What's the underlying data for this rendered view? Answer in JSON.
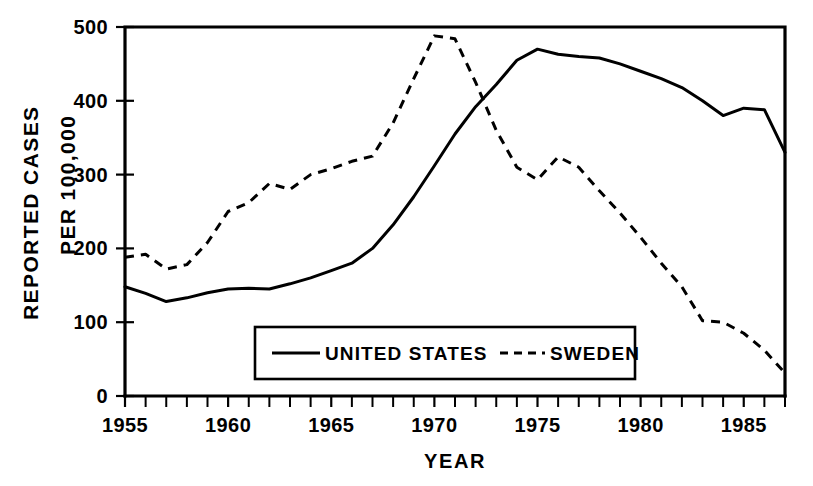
{
  "chart_data": {
    "type": "line",
    "title": "",
    "xlabel": "YEAR",
    "ylabel": "REPORTED CASES PER 100,000",
    "ylabel_line1": "REPORTED CASES",
    "ylabel_line2": "PER 100,000",
    "xlim": [
      1955,
      1987
    ],
    "ylim": [
      0,
      500
    ],
    "ytick_labels": [
      "0",
      "100",
      "200",
      "300",
      "400",
      "500"
    ],
    "ytick_values": [
      0,
      100,
      200,
      300,
      400,
      500
    ],
    "xtick_labels": [
      "1955",
      "1960",
      "1965",
      "1970",
      "1975",
      "1980",
      "1985"
    ],
    "xtick_values": [
      1955,
      1960,
      1965,
      1970,
      1975,
      1980,
      1985
    ],
    "xtick_minor_step": 1,
    "grid": false,
    "legend_position": "inside-bottom-center",
    "x": [
      1955,
      1956,
      1957,
      1958,
      1959,
      1960,
      1961,
      1962,
      1963,
      1964,
      1965,
      1966,
      1967,
      1968,
      1969,
      1970,
      1971,
      1972,
      1973,
      1974,
      1975,
      1976,
      1977,
      1978,
      1979,
      1980,
      1981,
      1982,
      1983,
      1984,
      1985,
      1986,
      1987
    ],
    "series": [
      {
        "name": "UNITED STATES",
        "style": "solid",
        "color": "#000000",
        "values": [
          148,
          139,
          128,
          133,
          140,
          145,
          146,
          145,
          152,
          160,
          170,
          180,
          200,
          232,
          270,
          312,
          355,
          392,
          422,
          455,
          470,
          463,
          460,
          458,
          450,
          440,
          430,
          418,
          400,
          380,
          390,
          388,
          330
        ]
      },
      {
        "name": "SWEDEN",
        "style": "dashed",
        "color": "#000000",
        "values": [
          188,
          192,
          172,
          178,
          208,
          250,
          262,
          288,
          280,
          300,
          308,
          318,
          325,
          370,
          430,
          488,
          484,
          425,
          360,
          310,
          293,
          324,
          310,
          278,
          248,
          215,
          180,
          148,
          102,
          100,
          85,
          62,
          31
        ]
      }
    ],
    "annotations": []
  },
  "legend": {
    "items": [
      {
        "label": "UNITED STATES",
        "style": "solid"
      },
      {
        "label": "SWEDEN",
        "style": "dashed"
      }
    ]
  }
}
